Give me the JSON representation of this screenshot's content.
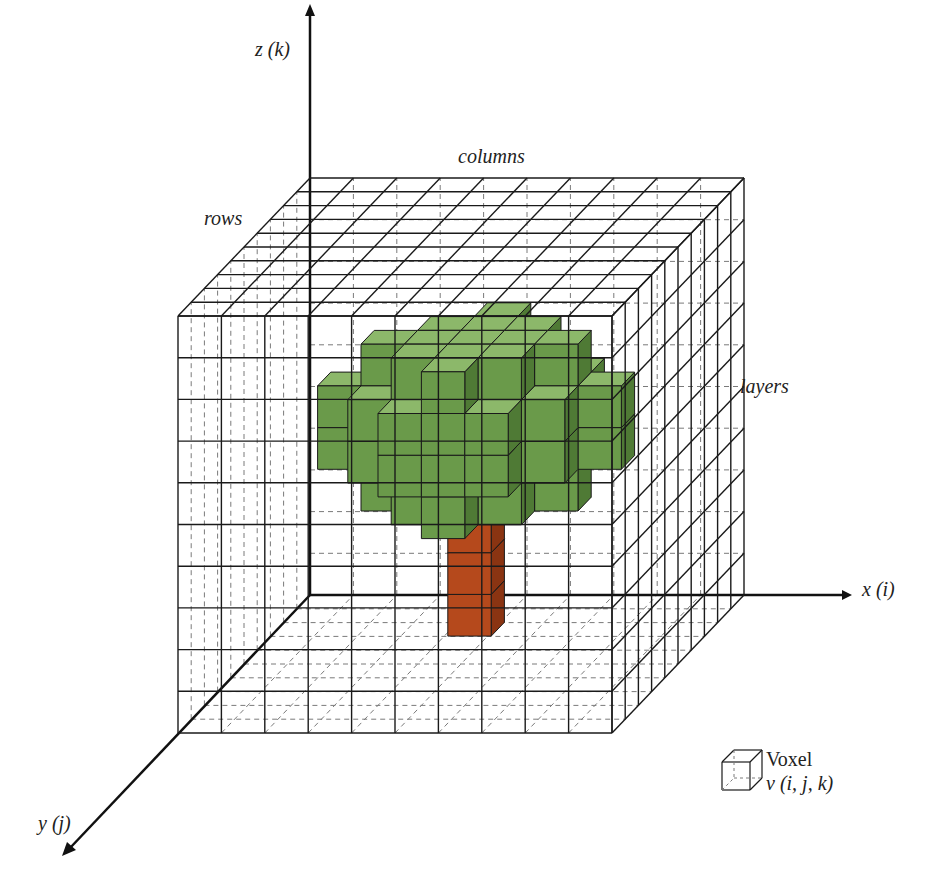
{
  "figure": {
    "labels": {
      "z_axis": "z (k)",
      "x_axis": "x (i)",
      "y_axis": "y (j)",
      "columns": "columns",
      "rows": "rows",
      "layers": "layers"
    },
    "legend": {
      "title": "Voxel",
      "subtitle": "v (i, j, k)"
    },
    "caption": {
      "status": "truncated at bottom edge, not legible"
    },
    "colors": {
      "grid_line": "#1a1a1a",
      "grid_dashed": "#7a7a7a",
      "canopy_front": "#6a9a4a",
      "canopy_top": "#8cb86a",
      "canopy_side": "#4f7a35",
      "trunk_front": "#b5491c",
      "trunk_side": "#8a3412",
      "axis": "#111111"
    },
    "grid": {
      "columns": 10,
      "rows": 10,
      "layers": 10
    }
  }
}
